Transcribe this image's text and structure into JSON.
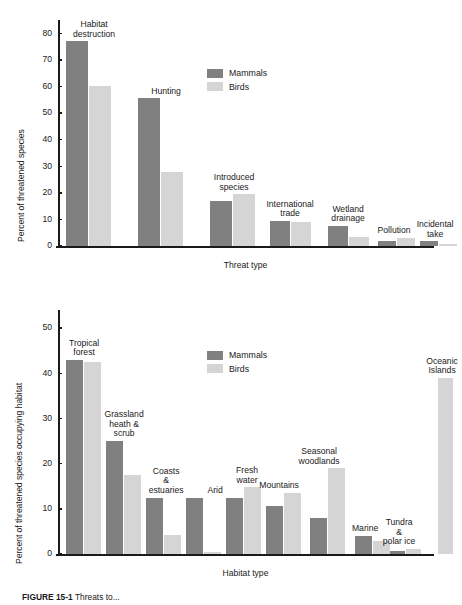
{
  "figure": {
    "caption_label": "FIGURE 15-1",
    "caption_text": "Threats to..."
  },
  "legend": {
    "mammals": "Mammals",
    "birds": "Birds",
    "color_mammals": "#808080",
    "color_birds": "#d5d5d5"
  },
  "chart_data": [
    {
      "type": "bar",
      "title": "",
      "xlabel": "Threat type",
      "ylabel": "Percent of threatened species",
      "ylim": [
        0,
        85
      ],
      "yticks": [
        0,
        10,
        20,
        30,
        40,
        50,
        60,
        70,
        80
      ],
      "grid": false,
      "legend_position": "inside-top-right",
      "categories": [
        "Habitat\ndestruction",
        "Hunting",
        "Introduced\nspecies",
        "International\ntrade",
        "Wetland\ndrainage",
        "Pollution",
        "Incidental\ntake"
      ],
      "series": [
        {
          "name": "Mammals",
          "values": [
            77,
            55.5,
            17,
            9.5,
            7.5,
            1.8,
            1.8
          ]
        },
        {
          "name": "Birds",
          "values": [
            60,
            28,
            19.5,
            9,
            3.5,
            3,
            0.6
          ]
        }
      ]
    },
    {
      "type": "bar",
      "title": "",
      "xlabel": "Habitat type",
      "ylabel": "Percent of threatened species occupying habitat",
      "ylim": [
        0,
        54
      ],
      "yticks": [
        0,
        10,
        20,
        30,
        40,
        50
      ],
      "grid": false,
      "legend_position": "inside-top-center",
      "categories": [
        "Tropical\nforest",
        "Grassland\nheath &\nscrub",
        "Coasts\n&\nestuaries",
        "Arid",
        "Fresh\nwater",
        "Mountains",
        "Seasonal\nwoodlands",
        "Marine",
        "Tundra\n&\npolar ice",
        "Oceanic\nIslands"
      ],
      "series": [
        {
          "name": "Mammals",
          "values": [
            43,
            25,
            12.5,
            12.5,
            12.4,
            10.6,
            7.9,
            4,
            0.6,
            0
          ]
        },
        {
          "name": "Birds",
          "values": [
            42.6,
            17.4,
            4.3,
            0.5,
            14.8,
            13.5,
            19,
            2.8,
            1.1,
            39
          ]
        }
      ]
    }
  ]
}
